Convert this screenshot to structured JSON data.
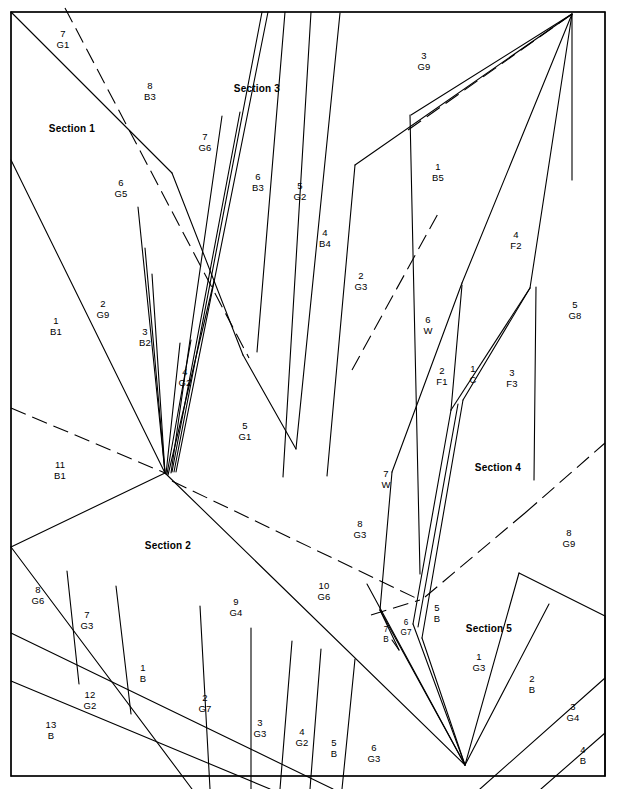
{
  "figure": {
    "frame": {
      "x": 11,
      "y": 12,
      "width": 594,
      "height": 764
    },
    "colors": {
      "line": "#000000",
      "background": "#ffffff",
      "text": "#000000"
    }
  },
  "sections": [
    {
      "name": "section-1",
      "label": "Section 1",
      "x": 72,
      "y": 128
    },
    {
      "name": "section-2",
      "label": "Section 2",
      "x": 168,
      "y": 545
    },
    {
      "name": "section-3",
      "label": "Section 3",
      "x": 257,
      "y": 88
    },
    {
      "name": "section-4",
      "label": "Section 4",
      "x": 498,
      "y": 467
    },
    {
      "name": "section-5",
      "label": "Section 5",
      "x": 489,
      "y": 628
    }
  ],
  "parcels": [
    {
      "num": "7",
      "code": "G1",
      "x": 63,
      "y": 39,
      "size": "normal"
    },
    {
      "num": "8",
      "code": "B3",
      "x": 150,
      "y": 91,
      "size": "normal"
    },
    {
      "num": "7",
      "code": "G6",
      "x": 205,
      "y": 142,
      "size": "normal"
    },
    {
      "num": "6",
      "code": "B3",
      "x": 258,
      "y": 182,
      "size": "normal"
    },
    {
      "num": "5",
      "code": "G2",
      "x": 300,
      "y": 191,
      "size": "normal"
    },
    {
      "num": "3",
      "code": "G9",
      "x": 424,
      "y": 61,
      "size": "normal"
    },
    {
      "num": "1",
      "code": "B5",
      "x": 438,
      "y": 172,
      "size": "normal"
    },
    {
      "num": "4",
      "code": "B4",
      "x": 325,
      "y": 238,
      "size": "normal"
    },
    {
      "num": "4",
      "code": "F2",
      "x": 516,
      "y": 240,
      "size": "normal"
    },
    {
      "num": "6",
      "code": "G5",
      "x": 121,
      "y": 188,
      "size": "normal"
    },
    {
      "num": "2",
      "code": "G3",
      "x": 361,
      "y": 281,
      "size": "normal"
    },
    {
      "num": "5",
      "code": "G8",
      "x": 575,
      "y": 310,
      "size": "normal"
    },
    {
      "num": "1",
      "code": "B1",
      "x": 56,
      "y": 326,
      "size": "normal"
    },
    {
      "num": "2",
      "code": "G9",
      "x": 103,
      "y": 309,
      "size": "normal"
    },
    {
      "num": "3",
      "code": "B2",
      "x": 145,
      "y": 337,
      "size": "normal"
    },
    {
      "num": "6",
      "code": "W",
      "x": 428,
      "y": 325,
      "size": "normal"
    },
    {
      "num": "4",
      "code": "G2",
      "x": 185,
      "y": 377,
      "size": "normal"
    },
    {
      "num": "2",
      "code": "F1",
      "x": 442,
      "y": 376,
      "size": "normal"
    },
    {
      "num": "1",
      "code": "C",
      "x": 473,
      "y": 374,
      "size": "normal"
    },
    {
      "num": "3",
      "code": "F3",
      "x": 512,
      "y": 378,
      "size": "normal"
    },
    {
      "num": "5",
      "code": "G1",
      "x": 245,
      "y": 431,
      "size": "normal"
    },
    {
      "num": "11",
      "code": "B1",
      "x": 60,
      "y": 470,
      "size": "normal"
    },
    {
      "num": "7",
      "code": "W",
      "x": 386,
      "y": 479,
      "size": "normal"
    },
    {
      "num": "8",
      "code": "G3",
      "x": 360,
      "y": 529,
      "size": "normal"
    },
    {
      "num": "8",
      "code": "G9",
      "x": 569,
      "y": 538,
      "size": "normal"
    },
    {
      "num": "8",
      "code": "G6",
      "x": 38,
      "y": 595,
      "size": "normal"
    },
    {
      "num": "7",
      "code": "G3",
      "x": 87,
      "y": 620,
      "size": "normal"
    },
    {
      "num": "9",
      "code": "G4",
      "x": 236,
      "y": 607,
      "size": "normal"
    },
    {
      "num": "10",
      "code": "G6",
      "x": 324,
      "y": 591,
      "size": "normal"
    },
    {
      "num": "5",
      "code": "B",
      "x": 437,
      "y": 613,
      "size": "normal"
    },
    {
      "num": "6",
      "code": "G7",
      "x": 406,
      "y": 627,
      "size": "tiny"
    },
    {
      "num": "7",
      "code": "B",
      "x": 386,
      "y": 634,
      "size": "tiny"
    },
    {
      "num": "1",
      "code": "G3",
      "x": 479,
      "y": 662,
      "size": "normal"
    },
    {
      "num": "1",
      "code": "B",
      "x": 143,
      "y": 673,
      "size": "normal"
    },
    {
      "num": "12",
      "code": "G2",
      "x": 90,
      "y": 700,
      "size": "normal"
    },
    {
      "num": "2",
      "code": "G7",
      "x": 205,
      "y": 703,
      "size": "normal"
    },
    {
      "num": "2",
      "code": "B",
      "x": 532,
      "y": 684,
      "size": "normal"
    },
    {
      "num": "13",
      "code": "B",
      "x": 51,
      "y": 730,
      "size": "normal"
    },
    {
      "num": "3",
      "code": "G3",
      "x": 260,
      "y": 728,
      "size": "normal"
    },
    {
      "num": "4",
      "code": "G2",
      "x": 302,
      "y": 737,
      "size": "normal"
    },
    {
      "num": "5",
      "code": "B",
      "x": 334,
      "y": 748,
      "size": "normal"
    },
    {
      "num": "6",
      "code": "G3",
      "x": 374,
      "y": 753,
      "size": "normal"
    },
    {
      "num": "3",
      "code": "G4",
      "x": 573,
      "y": 712,
      "size": "normal"
    },
    {
      "num": "4",
      "code": "B",
      "x": 583,
      "y": 755,
      "size": "normal"
    }
  ],
  "geometry": {
    "solid_lines": [
      [
        11,
        12,
        172,
        173
      ],
      [
        11,
        160,
        165,
        473
      ],
      [
        11,
        12,
        11,
        776
      ],
      [
        165,
        473,
        152,
        274
      ],
      [
        165,
        473,
        145,
        248
      ],
      [
        165,
        473,
        138,
        207
      ],
      [
        166,
        474,
        180,
        343
      ],
      [
        167,
        474,
        191,
        340
      ],
      [
        168,
        475,
        214,
        281
      ],
      [
        171,
        473,
        222,
        116
      ],
      [
        172,
        472,
        240,
        112
      ],
      [
        174,
        472,
        262,
        12
      ],
      [
        176,
        472,
        268,
        12
      ],
      [
        172,
        173,
        243,
        355
      ],
      [
        243,
        355,
        296,
        449
      ],
      [
        257,
        352,
        285,
        12
      ],
      [
        283,
        477,
        311,
        12
      ],
      [
        296,
        449,
        340,
        13
      ],
      [
        327,
        476,
        355,
        165
      ],
      [
        355,
        165,
        572,
        14
      ],
      [
        420,
        574,
        410,
        115
      ],
      [
        411,
        115,
        572,
        14
      ],
      [
        380,
        610,
        392,
        472
      ],
      [
        392,
        472,
        462,
        283
      ],
      [
        462,
        283,
        572,
        14
      ],
      [
        413,
        624,
        451,
        410
      ],
      [
        451,
        410,
        462,
        285
      ],
      [
        418,
        627,
        458,
        404
      ],
      [
        422,
        638,
        463,
        400
      ],
      [
        463,
        400,
        530,
        288
      ],
      [
        530,
        288,
        572,
        14
      ],
      [
        451,
        410,
        530,
        288
      ],
      [
        534,
        480,
        536,
        287
      ],
      [
        11,
        547,
        165,
        473
      ],
      [
        11,
        547,
        192,
        789
      ],
      [
        11,
        633,
        333,
        789
      ],
      [
        11,
        681,
        270,
        789
      ],
      [
        165,
        473,
        465,
        765
      ],
      [
        67,
        571,
        79,
        684
      ],
      [
        116,
        586,
        131,
        714
      ],
      [
        200,
        606,
        210,
        789
      ],
      [
        251,
        628,
        251,
        789
      ],
      [
        292,
        641,
        280,
        789
      ],
      [
        321,
        649,
        310,
        789
      ],
      [
        355,
        659,
        342,
        789
      ],
      [
        465,
        765,
        413,
        624
      ],
      [
        465,
        765,
        422,
        638
      ],
      [
        465,
        765,
        380,
        610
      ],
      [
        465,
        765,
        367,
        584
      ],
      [
        465,
        765,
        519,
        573
      ],
      [
        519,
        573,
        605,
        616
      ],
      [
        465,
        765,
        549,
        604
      ],
      [
        605,
        616,
        605,
        776
      ],
      [
        480,
        789,
        605,
        678
      ],
      [
        399,
        650,
        380,
        610
      ],
      [
        399,
        650,
        392,
        640
      ],
      [
        11,
        776,
        605,
        776
      ],
      [
        11,
        12,
        605,
        12
      ],
      [
        605,
        12,
        605,
        776
      ],
      [
        572,
        14,
        572,
        180
      ],
      [
        541,
        789,
        605,
        733
      ]
    ],
    "dashed_lines": [
      [
        65,
        8,
        249,
        358
      ],
      [
        11,
        408,
        165,
        473
      ],
      [
        172,
        481,
        420,
        600
      ],
      [
        371,
        615,
        420,
        600
      ],
      [
        425,
        597,
        525,
        513
      ],
      [
        525,
        513,
        605,
        443
      ],
      [
        408,
        130,
        572,
        14
      ],
      [
        352,
        370,
        440,
        210
      ]
    ]
  }
}
